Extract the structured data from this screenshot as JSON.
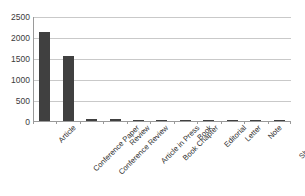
{
  "chart_data": {
    "type": "bar",
    "title": "",
    "subtitle": "",
    "xlabel": "",
    "ylabel": "",
    "categories": [
      "Article",
      "Conference Paper",
      "Conference Review",
      "Review",
      "Article in Press",
      "Book Chapter",
      "Book",
      "Editorial",
      "Letter",
      "Note",
      "Short Survey"
    ],
    "values": [
      2130,
      1560,
      50,
      40,
      15,
      8,
      3,
      2,
      2,
      1,
      1
    ],
    "ylim": [
      0,
      2500
    ],
    "yticks": [
      0,
      500,
      1000,
      1500,
      2000,
      2500
    ],
    "ytick_labels": [
      "0",
      "500",
      "1000",
      "1500",
      "2000",
      "2500"
    ],
    "grid": "horizontal",
    "legend": "none",
    "bar_color": "#404040",
    "gridline_color": "#c9c9c9",
    "axis_color": "#9a9a9a",
    "background_color": "#ffffff",
    "xlabel_rotation_deg": -45
  }
}
